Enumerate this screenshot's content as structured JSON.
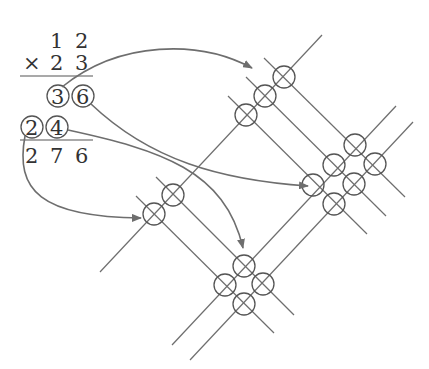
{
  "calculation": {
    "multiplicand": [
      "1",
      "2"
    ],
    "operator": "×",
    "multiplier": [
      "2",
      "3"
    ],
    "partial_row_1": [
      "3",
      "6"
    ],
    "partial_row_2": [
      "2",
      "4"
    ],
    "result": [
      "2",
      "7",
      "6"
    ]
  },
  "diagram": {
    "line_color": "#6e6e6e",
    "circle_color": "#555555",
    "intersection_groups": [
      {
        "name": "top-group",
        "count": 3,
        "value": "3"
      },
      {
        "name": "right-group",
        "count": 6,
        "value": "6"
      },
      {
        "name": "left-group",
        "count": 2,
        "value": "2"
      },
      {
        "name": "bottom-group",
        "count": 4,
        "value": "4"
      }
    ]
  }
}
